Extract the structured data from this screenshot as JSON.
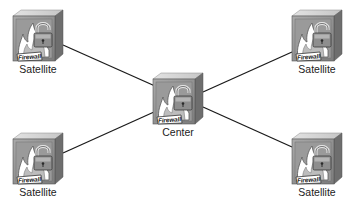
{
  "diagram": {
    "type": "network-topology",
    "icon_badge_text": "Firewall",
    "line_color": "#1a1a1a",
    "nodes": [
      {
        "id": "sat-tl",
        "label": "Satellite",
        "role": "satellite",
        "x": 11,
        "y": 8
      },
      {
        "id": "sat-tr",
        "label": "Satellite",
        "role": "satellite",
        "x": 290,
        "y": 8
      },
      {
        "id": "center",
        "label": "Center",
        "role": "hub",
        "x": 151,
        "y": 71
      },
      {
        "id": "sat-bl",
        "label": "Satellite",
        "role": "satellite",
        "x": 11,
        "y": 131
      },
      {
        "id": "sat-br",
        "label": "Satellite",
        "role": "satellite",
        "x": 290,
        "y": 131
      }
    ],
    "edges": [
      {
        "from": "sat-tl",
        "to": "center",
        "x1": 63,
        "y1": 45,
        "x2": 155,
        "y2": 86
      },
      {
        "from": "center",
        "to": "sat-tr",
        "x1": 203,
        "y1": 92,
        "x2": 292,
        "y2": 52
      },
      {
        "from": "sat-bl",
        "to": "center",
        "x1": 63,
        "y1": 153,
        "x2": 154,
        "y2": 112
      },
      {
        "from": "center",
        "to": "sat-br",
        "x1": 203,
        "y1": 107,
        "x2": 292,
        "y2": 147
      }
    ]
  }
}
